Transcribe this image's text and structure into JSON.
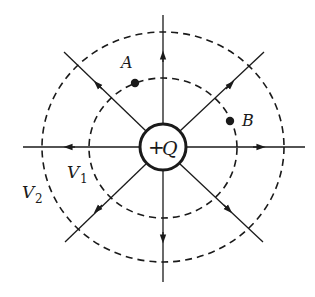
{
  "diagram": {
    "type": "electric-field-and-equipotentials",
    "colors": {
      "ink": "#1a1a1a",
      "background": "#ffffff"
    },
    "charge": {
      "sign": "+",
      "symbol": "Q"
    },
    "equipotentials": [
      {
        "name": "V",
        "subscript": "1"
      },
      {
        "name": "V",
        "subscript": "2"
      }
    ],
    "points": [
      {
        "label": "A"
      },
      {
        "label": "B"
      }
    ],
    "field_lines_count": 8
  }
}
